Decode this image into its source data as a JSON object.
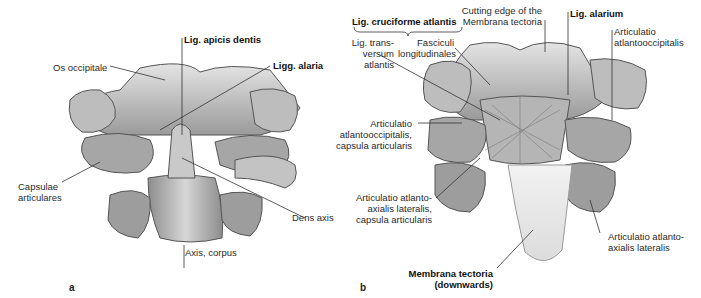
{
  "figure": {
    "panel_a": {
      "letter": "a",
      "labels": {
        "apicis": "Lig. apicis dentis",
        "occipitale": "Os occipitale",
        "alaria": "Ligg. alaria",
        "capsulae_1": "Capsulae",
        "capsulae_2": "articulares",
        "dens": "Dens axis",
        "corpus": "Axis, corpus"
      }
    },
    "panel_b": {
      "letter": "b",
      "labels": {
        "cruciforme": "Lig. cruciforme atlantis",
        "cutting_1": "Cutting edge of the",
        "cutting_2": "Membrana tectoria",
        "alarium": "Lig. alarium",
        "ao_1": "Articulatio",
        "ao_2": "atlantooccipitalis",
        "trans_1": "Lig. trans-",
        "trans_2": "versum",
        "trans_3": "atlantis",
        "fasc_1": "Fasciculi",
        "fasc_2": "longitudinales",
        "aoc_1": "Articulatio",
        "aoc_2": "atlantooccipitalis,",
        "aoc_3": "capsula articularis",
        "aalc_1": "Articulatio atlanto-",
        "aalc_2": "axialis lateralis,",
        "aalc_3": "capsula articularis",
        "aal_1": "Articulatio atlanto-",
        "aal_2": "axialis lateralis",
        "mt_1": "Membrana tectoria",
        "mt_2": "(downwards)"
      }
    },
    "colors": {
      "bone_light": "#d9d9d9",
      "bone_mid": "#a8a8a8",
      "bone_dark": "#6e6e6e",
      "membrane": "#ececec",
      "leader": "#333333"
    }
  }
}
